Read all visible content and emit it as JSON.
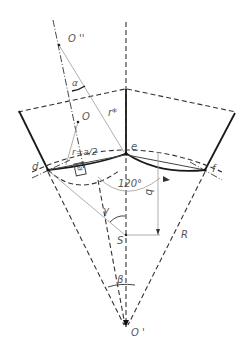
{
  "figure": {
    "type": "geometric construction diagram",
    "labels": {
      "o_double_prime": "O ''",
      "o": "O",
      "o_prime": "O '",
      "r_star": "r*",
      "r_half": "r=a/2",
      "alpha": "α",
      "a": "a",
      "e": "e",
      "d": "d",
      "f": "f",
      "angle_120": "120°",
      "b": "b",
      "gamma": "γ",
      "s": "S",
      "r_big": "R",
      "beta": "β"
    }
  }
}
